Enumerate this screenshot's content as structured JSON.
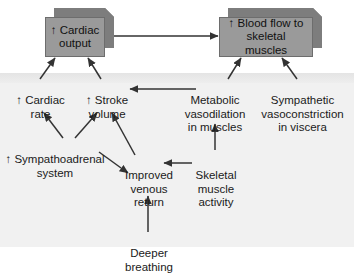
{
  "diagram": {
    "type": "flowchart",
    "colors": {
      "box_fill": "#9a9a9a",
      "box_bevel": "#7d7d7d",
      "box_border": "#6d6d6d",
      "panel_background": "#eeeeee",
      "page_background": "#ffffff",
      "text": "#1a1a1a",
      "arrow": "#333333"
    },
    "boxes": [
      {
        "id": "cardiac-output",
        "label": "↑ Cardiac\noutput"
      },
      {
        "id": "blood-flow",
        "label": "↑ Blood flow to\nskeletal muscles"
      }
    ],
    "nodes": [
      {
        "id": "cardiac-rate",
        "label": "↑ Cardiac\nrate"
      },
      {
        "id": "stroke-volume",
        "label": "↑ Stroke\nvolume"
      },
      {
        "id": "metabolic-vasodilation",
        "label": "Metabolic\nvasodilation\nin muscles"
      },
      {
        "id": "sympathetic-vasoconstriction",
        "label": "Sympathetic\nvasoconstriction\nin viscera"
      },
      {
        "id": "sympathoadrenal",
        "label": "↑ Sympathoadrenal\nsystem"
      },
      {
        "id": "venous-return",
        "label": "Improved\nvenous\nreturn"
      },
      {
        "id": "skeletal-muscle-activity",
        "label": "Skeletal\nmuscle\nactivity"
      },
      {
        "id": "deeper-breathing",
        "label": "Deeper\nbreathing"
      }
    ],
    "arrows": [
      {
        "from": "cardiac-output",
        "to": "blood-flow",
        "style": "horizontal-right"
      },
      {
        "from": "cardiac-rate",
        "to": "cardiac-output",
        "style": "diagonal-up-right"
      },
      {
        "from": "stroke-volume",
        "to": "cardiac-output",
        "style": "diagonal-up-left"
      },
      {
        "from": "metabolic-vasodilation",
        "to": "blood-flow",
        "style": "diagonal-up-left"
      },
      {
        "from": "sympathetic-vasoconstriction",
        "to": "blood-flow",
        "style": "diagonal-up-left"
      },
      {
        "from": "metabolic-vasodilation",
        "to": "stroke-volume",
        "style": "horizontal-left"
      },
      {
        "from": "sympathoadrenal",
        "to": "cardiac-rate",
        "style": "diagonal-up-left"
      },
      {
        "from": "sympathoadrenal",
        "to": "stroke-volume",
        "style": "diagonal-up-right"
      },
      {
        "from": "sympathoadrenal",
        "to": "venous-return",
        "style": "diagonal-down-right"
      },
      {
        "from": "venous-return",
        "to": "stroke-volume",
        "style": "diagonal-up-left"
      },
      {
        "from": "skeletal-muscle-activity",
        "to": "venous-return",
        "style": "horizontal-left"
      },
      {
        "from": "skeletal-muscle-activity",
        "to": "metabolic-vasodilation",
        "style": "vertical-up"
      },
      {
        "from": "deeper-breathing",
        "to": "venous-return",
        "style": "vertical-up"
      }
    ]
  }
}
